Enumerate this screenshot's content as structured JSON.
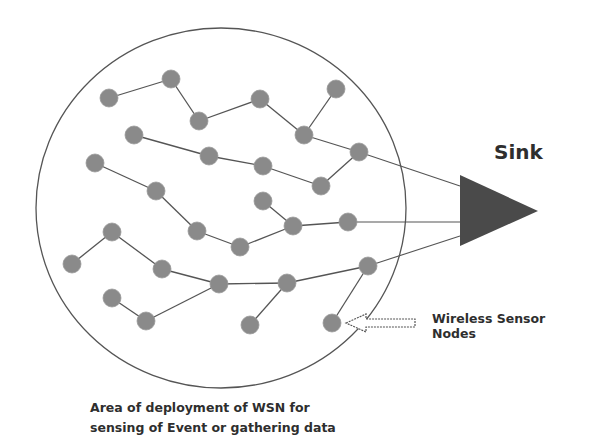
{
  "diagram": {
    "colors": {
      "node": "#8a8a8a",
      "edge": "#555555",
      "circle": "#555555",
      "sink": "#4a4a4a",
      "text": "#2e2e2e"
    },
    "labels": {
      "sink": "Sink",
      "nodes_line1": "Wireless Sensor",
      "nodes_line2": "Nodes",
      "caption_line1": "Area of deployment of WSN for",
      "caption_line2": "sensing of Event or gathering data"
    },
    "deployment_area": {
      "cx": 221,
      "cy": 208,
      "rx": 185,
      "ry": 180
    },
    "sink_triangle": {
      "points": [
        [
          460,
          175
        ],
        [
          460,
          246
        ],
        [
          538,
          211
        ]
      ]
    },
    "node_radius": 9,
    "nodes": [
      {
        "id": "A",
        "x": 109,
        "y": 98
      },
      {
        "id": "B",
        "x": 171,
        "y": 79
      },
      {
        "id": "C",
        "x": 199,
        "y": 121
      },
      {
        "id": "D",
        "x": 260,
        "y": 99
      },
      {
        "id": "E",
        "x": 336,
        "y": 89
      },
      {
        "id": "F",
        "x": 304,
        "y": 135
      },
      {
        "id": "G",
        "x": 359,
        "y": 152
      },
      {
        "id": "H",
        "x": 134,
        "y": 135
      },
      {
        "id": "I",
        "x": 209,
        "y": 156
      },
      {
        "id": "J",
        "x": 263,
        "y": 166
      },
      {
        "id": "K",
        "x": 321,
        "y": 186
      },
      {
        "id": "L",
        "x": 95,
        "y": 163
      },
      {
        "id": "M",
        "x": 156,
        "y": 191
      },
      {
        "id": "N",
        "x": 197,
        "y": 231
      },
      {
        "id": "O",
        "x": 240,
        "y": 247
      },
      {
        "id": "P",
        "x": 293,
        "y": 226
      },
      {
        "id": "Q",
        "x": 263,
        "y": 201
      },
      {
        "id": "R",
        "x": 348,
        "y": 222
      },
      {
        "id": "S",
        "x": 72,
        "y": 264
      },
      {
        "id": "T",
        "x": 112,
        "y": 232
      },
      {
        "id": "U",
        "x": 162,
        "y": 269
      },
      {
        "id": "V",
        "x": 219,
        "y": 284
      },
      {
        "id": "W",
        "x": 287,
        "y": 283
      },
      {
        "id": "X",
        "x": 368,
        "y": 266
      },
      {
        "id": "Y",
        "x": 112,
        "y": 298
      },
      {
        "id": "Z",
        "x": 146,
        "y": 321
      },
      {
        "id": "AA",
        "x": 250,
        "y": 325
      },
      {
        "id": "AB",
        "x": 332,
        "y": 323
      }
    ],
    "edges": [
      [
        "A",
        "B"
      ],
      [
        "B",
        "C"
      ],
      [
        "C",
        "D"
      ],
      [
        "D",
        "F"
      ],
      [
        "E",
        "F"
      ],
      [
        "F",
        "G"
      ],
      [
        "H",
        "I"
      ],
      [
        "I",
        "J"
      ],
      [
        "J",
        "K"
      ],
      [
        "K",
        "G"
      ],
      [
        "L",
        "M"
      ],
      [
        "M",
        "N"
      ],
      [
        "N",
        "O"
      ],
      [
        "O",
        "P"
      ],
      [
        "Q",
        "P"
      ],
      [
        "P",
        "R"
      ],
      [
        "T",
        "S"
      ],
      [
        "T",
        "U"
      ],
      [
        "U",
        "V"
      ],
      [
        "V",
        "W"
      ],
      [
        "W",
        "X"
      ],
      [
        "Y",
        "Z"
      ],
      [
        "Z",
        "V"
      ],
      [
        "W",
        "AA"
      ],
      [
        "X",
        "AB"
      ]
    ],
    "sink_links": [
      {
        "from": "G",
        "to": [
          460,
          186
        ]
      },
      {
        "from": "R",
        "to": [
          460,
          222
        ]
      },
      {
        "from": "X",
        "to": [
          460,
          236
        ]
      }
    ],
    "pointer_arrow": {
      "tip": [
        346,
        323
      ],
      "tail_x": 415,
      "y": 323,
      "target_node": "AB"
    }
  }
}
